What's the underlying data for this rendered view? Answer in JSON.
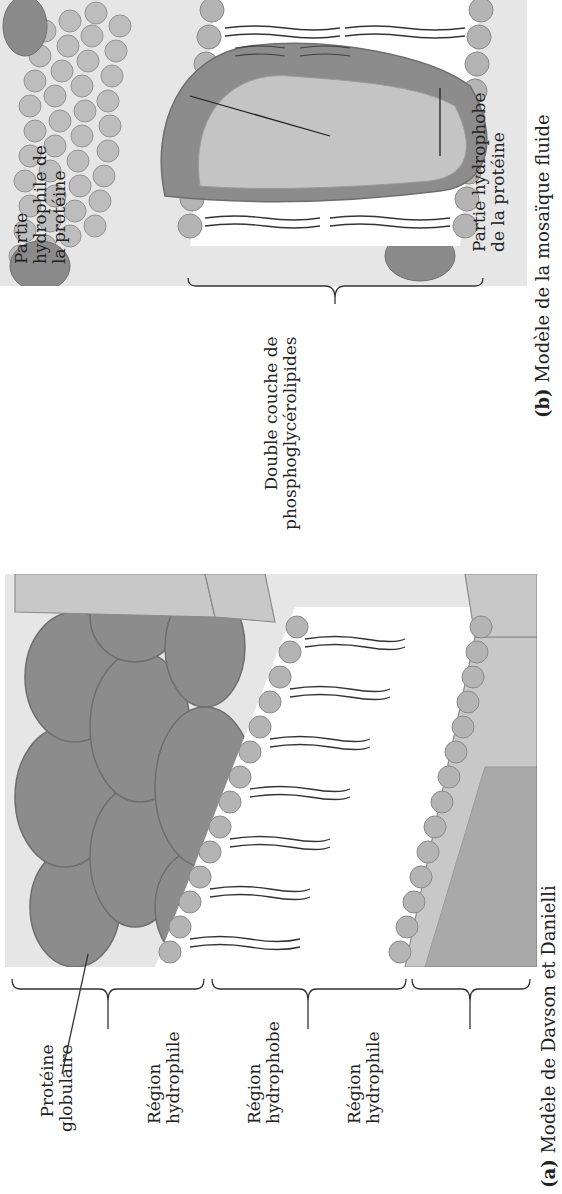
{
  "figure": {
    "panel_a": {
      "caption_letter": "(a)",
      "caption_text": "Modèle de Davson et Danielli",
      "labels": {
        "globular_protein": [
          "Protéine",
          "globulaire"
        ],
        "region_top": [
          "Région",
          "hydrophile"
        ],
        "region_middle": [
          "Région",
          "hydrophobe"
        ],
        "region_bottom": [
          "Région",
          "hydrophile"
        ]
      }
    },
    "panel_b": {
      "caption_letter": "(b)",
      "caption_text": "Modèle de la mosaïque fluide",
      "labels": {
        "bilayer": [
          "Double couche de",
          "phosphoglycérolipides"
        ],
        "hydrophilic_part": [
          "Partie",
          "hydrophile de",
          "la protéine"
        ],
        "hydrophobic_part": [
          "Partie hydrophobe",
          "de la protéine"
        ]
      }
    },
    "colors": {
      "background_box": "#e6e6e6",
      "protein_dark": "#8a8a8a",
      "protein_light": "#c4c4c4",
      "phospholipid_head": "#b0b0b0",
      "tail": "#333333"
    }
  }
}
